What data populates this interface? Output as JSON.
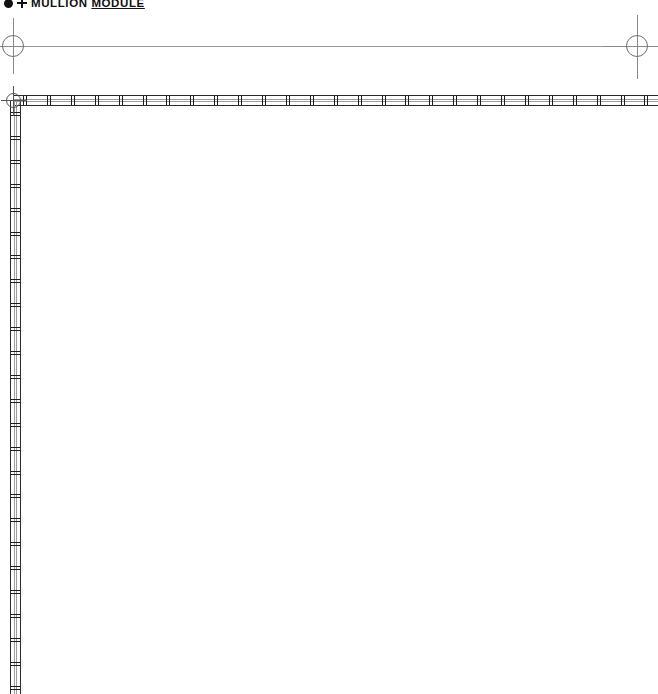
{
  "drawing": {
    "width": 658,
    "height": 694,
    "background_color": "#ffffff",
    "line_color": "#2b2b2b",
    "grid_color": "#9a9a9a"
  },
  "title": {
    "bullet_icon": "filled-dot-icon",
    "plus_icon": "plus-icon",
    "label_prefix": "MULLION ",
    "label_underlined": "MODULE"
  },
  "grid": {
    "datum_line": {
      "y": 46,
      "x_start": 13,
      "x_end": 638,
      "color": "#9a9a9a"
    },
    "bubbles": [
      {
        "name": "grid-bubble-left",
        "cx": 13,
        "cy": 46,
        "radius": 11
      },
      {
        "name": "grid-bubble-right",
        "cx": 637,
        "cy": 46,
        "radius": 11
      },
      {
        "name": "grid-bubble-corner",
        "cx": 13,
        "cy": 100,
        "radius": 7.5
      }
    ]
  },
  "mullions": {
    "horizontal": {
      "label": "horizontal-mullion-run",
      "x": 13,
      "y": 95,
      "length": 645,
      "thickness": 11,
      "tick_spacing": 23.9,
      "tick_count": 27,
      "tick_offset": 10
    },
    "vertical": {
      "label": "vertical-mullion-run",
      "x": 10,
      "y": 100,
      "length": 594,
      "thickness": 11,
      "tick_spacing": 23.9,
      "tick_count": 25,
      "tick_offset": 12
    }
  }
}
